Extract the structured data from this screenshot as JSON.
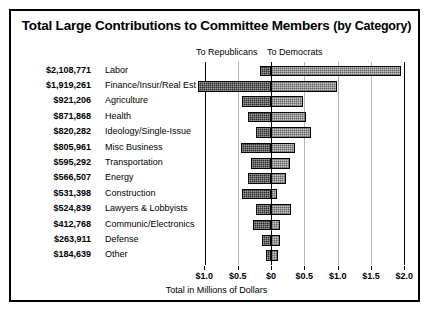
{
  "chart_data": {
    "type": "bar",
    "orientation": "horizontal-diverging",
    "title": "Total Large Contributions to Committee Members (by Category)",
    "title_main": "Total Large Contributions to Committee Members",
    "title_sub": "(by Category)",
    "xlabel": "Total in Millions of Dollars",
    "ylabel": "",
    "legend": [
      "To Republicans",
      "To Democrats"
    ],
    "legend_position": "top",
    "grid": false,
    "xlim": [
      -1.0,
      2.0
    ],
    "xticks": [
      -1.0,
      -0.5,
      0,
      0.5,
      1.0,
      1.5,
      2.0
    ],
    "xticklabels": [
      "$1.0",
      "$0.5",
      "$0",
      "$0.5",
      "$1.0",
      "$1.5",
      "$2.0"
    ],
    "categories": [
      "Labor",
      "Finance/Insur/Real Est",
      "Agriculture",
      "Health",
      "Ideology/Single-Issue",
      "Misc Business",
      "Transportation",
      "Energy",
      "Construction",
      "Lawyers & Lobbyists",
      "Communic/Electronics",
      "Defense",
      "Other"
    ],
    "totals": [
      "$2,108,771",
      "$1,919,261",
      "$921,206",
      "$871,868",
      "$820,282",
      "$805,961",
      "$595,292",
      "$566,507",
      "$531,398",
      "$524,839",
      "$412,768",
      "$263,911",
      "$184,639"
    ],
    "series": [
      {
        "name": "To Republicans",
        "values": [
          0.16,
          1.09,
          0.44,
          0.35,
          0.22,
          0.45,
          0.3,
          0.34,
          0.44,
          0.22,
          0.27,
          0.13,
          0.08
        ]
      },
      {
        "name": "To Democrats",
        "values": [
          1.95,
          0.99,
          0.48,
          0.52,
          0.6,
          0.36,
          0.29,
          0.23,
          0.09,
          0.3,
          0.14,
          0.13,
          0.1
        ]
      }
    ],
    "rows": [
      {
        "label": "Labor",
        "total": "$2,108,771",
        "rep": 0.16,
        "dem": 1.95
      },
      {
        "label": "Finance/Insur/Real Est",
        "total": "$1,919,261",
        "rep": 1.09,
        "dem": 0.99
      },
      {
        "label": "Agriculture",
        "total": "$921,206",
        "rep": 0.44,
        "dem": 0.48
      },
      {
        "label": "Health",
        "total": "$871,868",
        "rep": 0.35,
        "dem": 0.52
      },
      {
        "label": "Ideology/Single-Issue",
        "total": "$820,282",
        "rep": 0.22,
        "dem": 0.6
      },
      {
        "label": "Misc Business",
        "total": "$805,961",
        "rep": 0.45,
        "dem": 0.36
      },
      {
        "label": "Transportation",
        "total": "$595,292",
        "rep": 0.3,
        "dem": 0.29
      },
      {
        "label": "Energy",
        "total": "$566,507",
        "rep": 0.34,
        "dem": 0.23
      },
      {
        "label": "Construction",
        "total": "$531,398",
        "rep": 0.44,
        "dem": 0.09
      },
      {
        "label": "Lawyers & Lobbyists",
        "total": "$524,839",
        "rep": 0.22,
        "dem": 0.3
      },
      {
        "label": "Communic/Electronics",
        "total": "$412,768",
        "rep": 0.27,
        "dem": 0.14
      },
      {
        "label": "Defense",
        "total": "$263,911",
        "rep": 0.13,
        "dem": 0.13
      },
      {
        "label": "Other",
        "total": "$184,639",
        "rep": 0.08,
        "dem": 0.1
      }
    ],
    "colors": {
      "republican_fill": "#2a2a2a",
      "democrat_fill": "#c9c9c9",
      "outline": "#000000",
      "background": "#ffffff"
    }
  }
}
